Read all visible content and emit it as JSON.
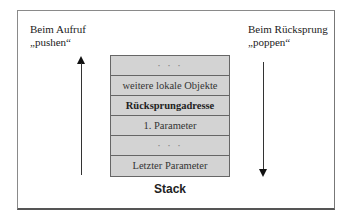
{
  "diagram": {
    "left_label": {
      "line1": "Beim Aufruf",
      "line2": "„pushen“"
    },
    "right_label": {
      "line1": "Beim Rücksprung",
      "line2": "„poppen“"
    },
    "stack": {
      "title": "Stack",
      "rows": [
        {
          "text": "· · ·",
          "style": "dots"
        },
        {
          "text": "weitere lokale Objekte",
          "style": "normal"
        },
        {
          "text": "Rücksprungadresse",
          "style": "bold"
        },
        {
          "text": "1. Parameter",
          "style": "normal"
        },
        {
          "text": "· · ·",
          "style": "dots"
        },
        {
          "text": "Letzter Parameter",
          "style": "normal"
        }
      ],
      "fill_color": "#d3d3d3",
      "border_color": "#666666"
    },
    "arrows": {
      "left": {
        "direction": "up",
        "meaning": "push"
      },
      "right": {
        "direction": "down",
        "meaning": "pop"
      }
    }
  }
}
